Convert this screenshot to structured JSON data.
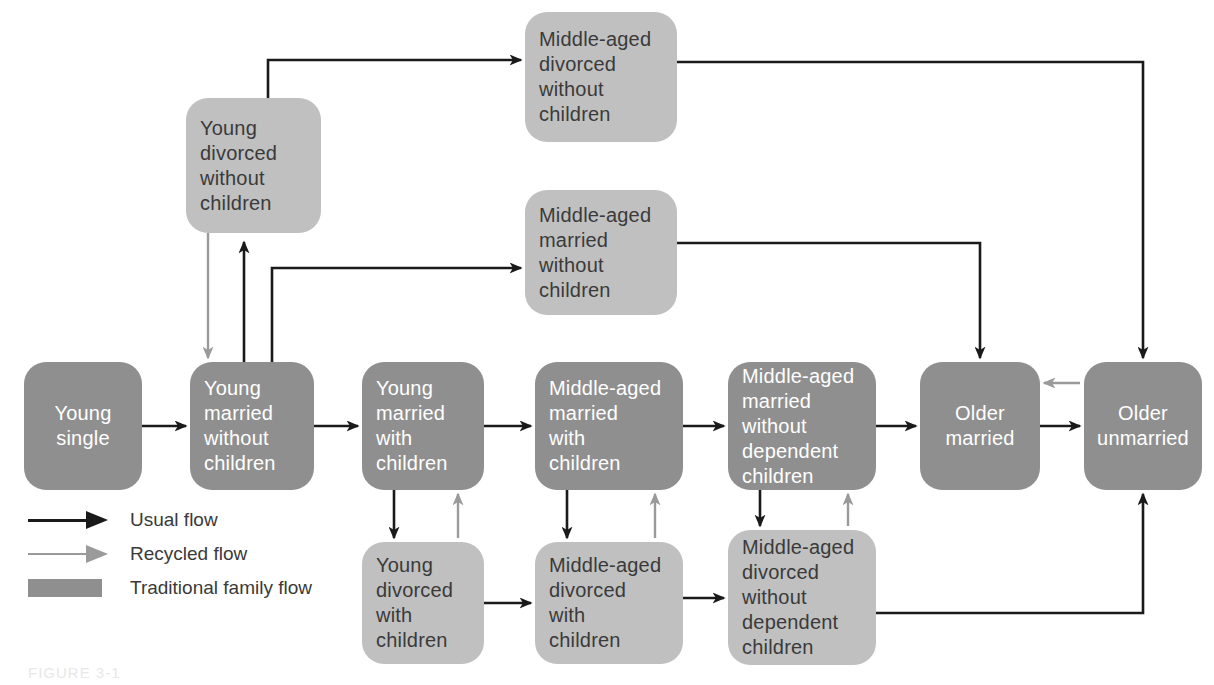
{
  "figure": {
    "caption": "FIGURE 3-1"
  },
  "legend": {
    "items": [
      {
        "key": "usual-flow-arrow",
        "label": "Usual flow",
        "color": "#1a1a1a",
        "kind": "arrow"
      },
      {
        "key": "recycled-flow-arrow",
        "label": "Recycled flow",
        "color": "#9a9a9a",
        "kind": "arrow"
      },
      {
        "key": "traditional-family-flow-swatch",
        "label": "Traditional family flow",
        "color": "#8f8f8f",
        "kind": "swatch"
      }
    ]
  },
  "colors": {
    "traditional_box": "#8f8f8f",
    "alternate_box": "#c0c0c0",
    "usual_flow": "#1a1a1a",
    "recycled_flow": "#9a9a9a",
    "background": "#ffffff",
    "dark_text": "#3a3a3a",
    "light_text": "#ffffff"
  },
  "nodes": [
    {
      "id": "young-single",
      "label": "Young\nsingle",
      "style": "dark",
      "align": "center",
      "x": 24,
      "y": 362,
      "w": 118,
      "h": 128
    },
    {
      "id": "young-married-no-children",
      "label": "Young\nmarried\nwithout\nchildren",
      "style": "dark",
      "align": "left",
      "x": 190,
      "y": 362,
      "w": 124,
      "h": 128
    },
    {
      "id": "young-married-children",
      "label": "Young\nmarried\nwith\nchildren",
      "style": "dark",
      "align": "left",
      "x": 362,
      "y": 362,
      "w": 122,
      "h": 128
    },
    {
      "id": "middle-married-children",
      "label": "Middle-aged\nmarried\nwith\nchildren",
      "style": "dark",
      "align": "left",
      "x": 535,
      "y": 362,
      "w": 148,
      "h": 128
    },
    {
      "id": "middle-married-no-dep",
      "label": "Middle-aged\nmarried\nwithout\ndependent\nchildren",
      "style": "dark",
      "align": "left",
      "x": 728,
      "y": 362,
      "w": 148,
      "h": 128
    },
    {
      "id": "older-married",
      "label": "Older\nmarried",
      "style": "dark",
      "align": "center",
      "x": 920,
      "y": 362,
      "w": 120,
      "h": 128
    },
    {
      "id": "older-unmarried",
      "label": "Older\nunmarried",
      "style": "dark",
      "align": "center",
      "x": 1084,
      "y": 362,
      "w": 118,
      "h": 128
    },
    {
      "id": "young-divorced-no-children",
      "label": "Young\ndivorced\nwithout\nchildren",
      "style": "light",
      "align": "left",
      "x": 186,
      "y": 98,
      "w": 135,
      "h": 135
    },
    {
      "id": "middle-divorced-no-children",
      "label": "Middle-aged\ndivorced\nwithout\nchildren",
      "style": "light",
      "align": "left",
      "x": 525,
      "y": 12,
      "w": 152,
      "h": 130
    },
    {
      "id": "middle-married-no-children",
      "label": "Middle-aged\nmarried\nwithout\nchildren",
      "style": "light",
      "align": "left",
      "x": 525,
      "y": 190,
      "w": 152,
      "h": 125
    },
    {
      "id": "young-divorced-children",
      "label": "Young\ndivorced\nwith\nchildren",
      "style": "light",
      "align": "left",
      "x": 362,
      "y": 542,
      "w": 122,
      "h": 122
    },
    {
      "id": "middle-divorced-children",
      "label": "Middle-aged\ndivorced\nwith\nchildren",
      "style": "light",
      "align": "left",
      "x": 535,
      "y": 542,
      "w": 148,
      "h": 122
    },
    {
      "id": "middle-divorced-no-dep",
      "label": "Middle-aged\ndivorced\nwithout\ndependent\nchildren",
      "style": "light",
      "align": "left",
      "x": 728,
      "y": 530,
      "w": 148,
      "h": 135
    }
  ],
  "chart_data": {
    "type": "diagram",
    "edges": [
      {
        "from": "young-single",
        "to": "young-married-no-children",
        "kind": "usual"
      },
      {
        "from": "young-married-no-children",
        "to": "young-married-children",
        "kind": "usual"
      },
      {
        "from": "young-married-children",
        "to": "middle-married-children",
        "kind": "usual"
      },
      {
        "from": "middle-married-children",
        "to": "middle-married-no-dep",
        "kind": "usual"
      },
      {
        "from": "middle-married-no-dep",
        "to": "older-married",
        "kind": "usual"
      },
      {
        "from": "older-married",
        "to": "older-unmarried",
        "kind": "usual"
      },
      {
        "from": "young-married-no-children",
        "to": "young-divorced-no-children",
        "kind": "usual"
      },
      {
        "from": "young-divorced-no-children",
        "to": "young-married-no-children",
        "kind": "recycled"
      },
      {
        "from": "young-married-no-children",
        "to": "middle-married-no-children",
        "kind": "usual"
      },
      {
        "from": "young-divorced-no-children",
        "to": "middle-divorced-no-children",
        "kind": "usual"
      },
      {
        "from": "middle-divorced-no-children",
        "to": "older-unmarried",
        "kind": "usual"
      },
      {
        "from": "middle-married-no-children",
        "to": "older-married",
        "kind": "usual"
      },
      {
        "from": "young-married-children",
        "to": "young-divorced-children",
        "kind": "usual"
      },
      {
        "from": "young-divorced-children",
        "to": "young-married-children",
        "kind": "recycled"
      },
      {
        "from": "middle-married-children",
        "to": "middle-divorced-children",
        "kind": "usual"
      },
      {
        "from": "middle-divorced-children",
        "to": "middle-married-children",
        "kind": "recycled"
      },
      {
        "from": "middle-married-no-dep",
        "to": "middle-divorced-no-dep",
        "kind": "usual"
      },
      {
        "from": "middle-divorced-no-dep",
        "to": "middle-married-no-dep",
        "kind": "recycled"
      },
      {
        "from": "young-divorced-children",
        "to": "middle-divorced-children",
        "kind": "usual"
      },
      {
        "from": "middle-divorced-children",
        "to": "middle-divorced-no-dep",
        "kind": "usual"
      },
      {
        "from": "middle-divorced-no-dep",
        "to": "older-unmarried",
        "kind": "usual"
      },
      {
        "from": "older-unmarried",
        "to": "older-married",
        "kind": "recycled"
      }
    ]
  }
}
